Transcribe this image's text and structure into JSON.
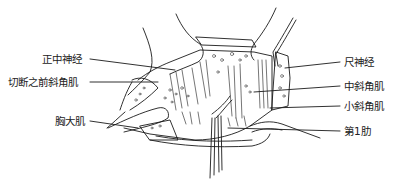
{
  "figure": {
    "type": "anatomical surgical illustration",
    "labels_left": [
      {
        "id": "median-nerve",
        "text": "正中神经"
      },
      {
        "id": "cut-anterior-scalene",
        "text": "切断之前斜角肌"
      },
      {
        "id": "pectoralis-major",
        "text": "胸大肌"
      }
    ],
    "labels_right": [
      {
        "id": "ulnar-nerve",
        "text": "尺神经"
      },
      {
        "id": "middle-scalene",
        "text": "中斜角肌"
      },
      {
        "id": "scalenus-minimus",
        "text": "小斜角肌"
      },
      {
        "id": "first-rib",
        "text": "第1肋"
      }
    ],
    "line_color": "#1a1a1a"
  }
}
